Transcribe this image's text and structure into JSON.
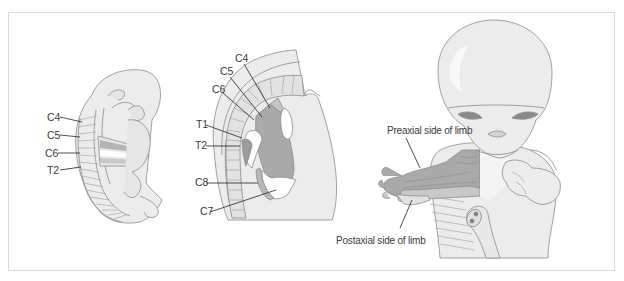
{
  "figure": {
    "panels": [
      {
        "id": "early-embryo",
        "labels": [
          {
            "text": "C4",
            "x": 47,
            "y": 113
          },
          {
            "text": "C5",
            "x": 47,
            "y": 131
          },
          {
            "text": "C6",
            "x": 45,
            "y": 149
          },
          {
            "text": "T2",
            "x": 47,
            "y": 166
          }
        ]
      },
      {
        "id": "limb-bud-closeup",
        "labels": [
          {
            "text": "C4",
            "x": 235,
            "y": 54
          },
          {
            "text": "C5",
            "x": 220,
            "y": 67
          },
          {
            "text": "C6",
            "x": 212,
            "y": 85
          },
          {
            "text": "T1",
            "x": 196,
            "y": 120
          },
          {
            "text": "T2",
            "x": 195,
            "y": 140
          },
          {
            "text": "C8",
            "x": 195,
            "y": 178
          },
          {
            "text": "C7",
            "x": 200,
            "y": 207
          }
        ]
      },
      {
        "id": "fetus-with-limb",
        "labels": [
          {
            "text": "Preaxial side of limb",
            "x": 387,
            "y": 126
          },
          {
            "text": "Postaxial side of limb",
            "x": 336,
            "y": 236
          }
        ]
      }
    ],
    "colors": {
      "skin": "#ececec",
      "outline": "#8a8a8a",
      "dermatome_dark": "#a9a9a9",
      "dermatome_mid": "#c4c4c4",
      "dermatome_light": "#ffffff",
      "text": "#3a3a3a",
      "frame_border": "#d9d9d9"
    }
  }
}
